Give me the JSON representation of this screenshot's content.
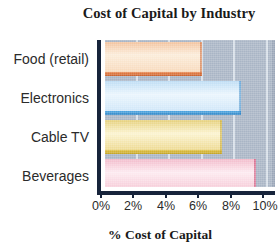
{
  "chart_data": {
    "type": "bar",
    "orientation": "horizontal",
    "title": "Cost of Capital by Industry",
    "xlabel": "% Cost of Capital",
    "ylabel": "",
    "categories": [
      "Food (retail)",
      "Electronics",
      "Cable TV",
      "Beverages"
    ],
    "values": [
      5.7,
      8.0,
      6.9,
      8.9
    ],
    "value_unit": "%",
    "xlim": [
      0,
      10
    ],
    "xticks": [
      0,
      2,
      4,
      6,
      8,
      10
    ],
    "xtick_labels": [
      "0%",
      "2%",
      "4%",
      "6%",
      "8%",
      "10%"
    ],
    "grid": "vertical",
    "legend": "none",
    "bar_colors": [
      "#e8834a",
      "#3d9ede",
      "#dfc03f",
      "#d64a78"
    ],
    "bar_fill_colors": [
      "#f6d4b4",
      "#cfe4f6",
      "#f0dc9a",
      "#f6c9d6"
    ],
    "plot_background": "#a9b5c5",
    "gridline_color": "#dfe6ed",
    "axis_color": "#17243b"
  },
  "axis": {
    "tick_0": "0%",
    "tick_1": "2%",
    "tick_2": "4%",
    "tick_3": "6%",
    "tick_4": "8%",
    "tick_5": "10%"
  }
}
